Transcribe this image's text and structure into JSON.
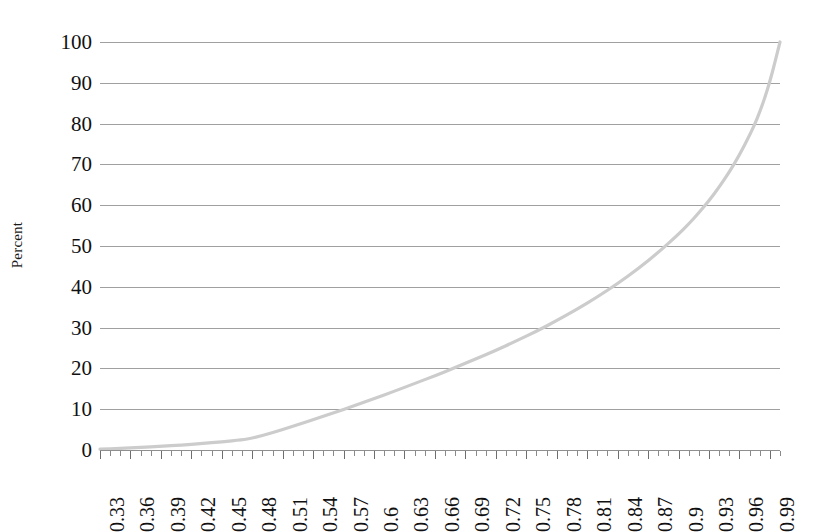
{
  "chart_data": {
    "type": "line",
    "title": "",
    "xlabel": "",
    "ylabel": "Percent",
    "xlim": [
      0.33,
      1.0
    ],
    "ylim": [
      0,
      100
    ],
    "grid": true,
    "legend": "none",
    "series_color": "#cccccc",
    "gridline_color": "#8f8f8f",
    "x_tick_labels": [
      "0.33",
      "0.36",
      "0.39",
      "0.42",
      "0.45",
      "0.48",
      "0.51",
      "0.54",
      "0.57",
      "0.6",
      "0.63",
      "0.66",
      "0.69",
      "0.72",
      "0.75",
      "0.78",
      "0.81",
      "0.84",
      "0.87",
      "0.9",
      "0.93",
      "0.96",
      "0.99"
    ],
    "x_tick_values": [
      0.33,
      0.36,
      0.39,
      0.42,
      0.45,
      0.48,
      0.51,
      0.54,
      0.57,
      0.6,
      0.63,
      0.66,
      0.69,
      0.72,
      0.75,
      0.78,
      0.81,
      0.84,
      0.87,
      0.9,
      0.93,
      0.96,
      0.99
    ],
    "x_minor_tick_step": 0.01,
    "y_tick_labels": [
      "0",
      "10",
      "20",
      "30",
      "40",
      "50",
      "60",
      "70",
      "80",
      "90",
      "100"
    ],
    "y_tick_values": [
      0,
      10,
      20,
      30,
      40,
      50,
      60,
      70,
      80,
      90,
      100
    ],
    "x": [
      0.33,
      0.35,
      0.37,
      0.39,
      0.41,
      0.43,
      0.45,
      0.47,
      0.48,
      0.5,
      0.52,
      0.54,
      0.56,
      0.58,
      0.6,
      0.62,
      0.64,
      0.66,
      0.68,
      0.7,
      0.72,
      0.74,
      0.76,
      0.78,
      0.8,
      0.82,
      0.84,
      0.86,
      0.88,
      0.9,
      0.91,
      0.92,
      0.93,
      0.94,
      0.95,
      0.96,
      0.97,
      0.975,
      0.98,
      0.985,
      0.99,
      0.995,
      1.0
    ],
    "values": [
      0.2,
      0.4,
      0.6,
      0.9,
      1.2,
      1.6,
      2.0,
      2.5,
      2.9,
      4.2,
      5.8,
      7.4,
      9.1,
      10.8,
      12.6,
      14.4,
      16.3,
      18.2,
      20.2,
      22.3,
      24.4,
      26.7,
      29.1,
      31.7,
      34.5,
      37.5,
      40.8,
      44.4,
      48.4,
      52.9,
      55.4,
      58.1,
      61.1,
      64.4,
      68.1,
      72.3,
      77.1,
      79.8,
      82.8,
      86.3,
      90.3,
      95.0,
      100.0
    ]
  }
}
